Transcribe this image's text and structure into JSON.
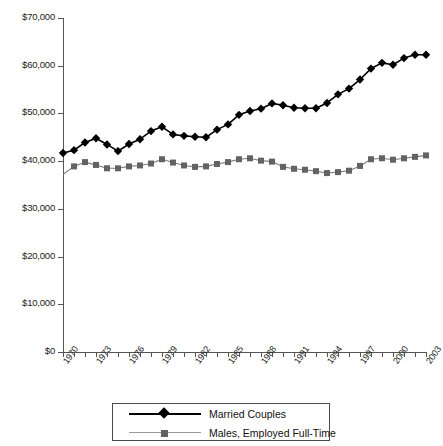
{
  "chart_data": {
    "type": "line",
    "title": "",
    "xlabel": "",
    "ylabel": "",
    "ylim": [
      0,
      70000
    ],
    "xlim": [
      1970,
      2003
    ],
    "grid": false,
    "legend_position": "bottom",
    "y_ticks": [
      "$0",
      "$10,000",
      "$20,000",
      "$30,000",
      "$40,000",
      "$50,000",
      "$60,000",
      "$70,000"
    ],
    "y_tick_values": [
      0,
      10000,
      20000,
      30000,
      40000,
      50000,
      60000,
      70000
    ],
    "x_tick_labels": [
      "1970",
      "1973",
      "1976",
      "1979",
      "1982",
      "1985",
      "1988",
      "1991",
      "1994",
      "1997",
      "2000",
      "2003"
    ],
    "x": [
      1970,
      1971,
      1972,
      1973,
      1974,
      1975,
      1976,
      1977,
      1978,
      1979,
      1980,
      1981,
      1982,
      1983,
      1984,
      1985,
      1986,
      1987,
      1988,
      1989,
      1990,
      1991,
      1992,
      1993,
      1994,
      1995,
      1996,
      1997,
      1998,
      1999,
      2000,
      2001,
      2002,
      2003
    ],
    "series": [
      {
        "name": "Married Couples",
        "color": "#000000",
        "marker": "diamond",
        "values": [
          41700,
          42300,
          43900,
          44800,
          43500,
          42100,
          43600,
          44600,
          46300,
          47200,
          45600,
          45300,
          45100,
          45000,
          46600,
          47700,
          49700,
          50500,
          51000,
          52100,
          51700,
          51200,
          51100,
          51100,
          52200,
          54000,
          55200,
          57100,
          59400,
          60600,
          60200,
          61600,
          62300,
          62300
        ]
      },
      {
        "name": "Males, Employed Full-Time",
        "color": "#7d7d7d",
        "marker": "square",
        "values": [
          37200,
          38900,
          39800,
          39200,
          38500,
          38500,
          38900,
          39100,
          39500,
          40400,
          39700,
          39100,
          38800,
          38900,
          39400,
          39800,
          40400,
          40600,
          40100,
          39900,
          38800,
          38400,
          38200,
          37900,
          37500,
          37700,
          38000,
          39000,
          40400,
          40600,
          40300,
          40600,
          40900,
          41200
        ]
      }
    ]
  },
  "legend": {
    "items": [
      {
        "label": "Married Couples"
      },
      {
        "label": "Males, Employed Full-Time"
      }
    ]
  }
}
